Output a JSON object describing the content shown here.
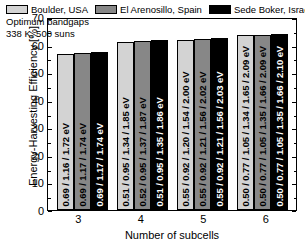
{
  "chart_data": {
    "type": "bar",
    "title": "",
    "xlabel": "Number of subcells",
    "ylabel": "Energy-Harvesting Efficiency [%]",
    "ylim": [
      0,
      70
    ],
    "yticks": [
      70,
      60,
      50,
      40,
      30,
      20,
      10,
      0
    ],
    "categories": [
      "3",
      "4",
      "5",
      "6"
    ],
    "grid": false,
    "legend_position": "top",
    "annotation_line1": "Optimum bandgaps",
    "annotation_line2": "338 K, 500 suns",
    "series": [
      {
        "name": "Boulder, USA",
        "color": "#d3d3d3",
        "values": [
          56.5,
          61.0,
          61.8,
          63.3
        ],
        "point_labels": [
          "0.69 / 1.16 / 1.72 eV",
          "0.51 / 0.95 / 1.34 / 1.85 eV",
          "0.55 / 0.92 / 1.20 / 1.54 / 2.00 eV",
          "0.50 / 0.77 / 1.05 / 1.34 / 1.65 / 2.09 eV"
        ]
      },
      {
        "name": "El Arenosillo, Spain",
        "color": "#878787",
        "values": [
          57.0,
          61.4,
          62.2,
          63.6
        ],
        "point_labels": [
          "0.69 / 1.17 / 1.74 eV",
          "0.52 / 0.95 / 1.37 / 1.87 eV",
          "0.55 / 0.92 / 1.21 / 1.56 / 2.02 eV",
          "0.50 / 0.77 / 1.05 / 1.35 / 1.66 / 2.09 eV"
        ]
      },
      {
        "name": "Sede Boker, Israel",
        "color": "#000000",
        "values": [
          57.2,
          61.6,
          62.4,
          63.8
        ],
        "point_labels": [
          "0.69 / 1.17 / 1.74 eV",
          "0.51 / 0.95 / 1.35 / 1.86 eV",
          "0.55 / 0.92 / 1.21 / 1.56 / 2.03 eV",
          "0.50 / 0.77 / 1.05 / 1.35 / 1.66 / 2.10 eV"
        ]
      }
    ]
  }
}
